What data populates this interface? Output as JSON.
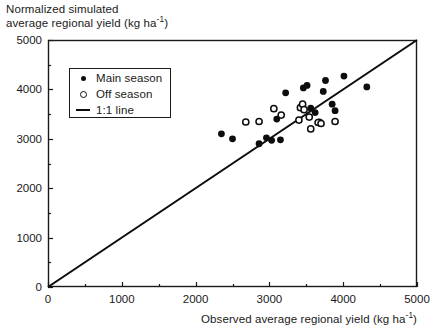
{
  "chart_data": {
    "type": "scatter",
    "title": "",
    "xlabel": "Observed average regional yield (kg ha-1)",
    "ylabel": "Normalized simulated average regional yield (kg ha-1)",
    "ylabel_line1": "Normalized simulated",
    "ylabel_line2": "average regional yield (kg ha",
    "xlabel_prefix": "Observed average regional yield (kg ha",
    "unit_exponent": "-1",
    "unit_suffix": ")",
    "xlim": [
      0,
      5000
    ],
    "ylim": [
      0,
      5000
    ],
    "xticks": [
      0,
      1000,
      2000,
      3000,
      4000,
      5000
    ],
    "yticks": [
      0,
      1000,
      2000,
      3000,
      4000,
      5000
    ],
    "xtick_labels": [
      "0",
      "1000",
      "2000",
      "3000",
      "4000",
      "5000"
    ],
    "ytick_labels": [
      "0",
      "1000",
      "2000",
      "3000",
      "4000",
      "5000"
    ],
    "minor_tick_step": 500,
    "grid": false,
    "legend_position": "upper left",
    "legend": [
      {
        "key": "filled-circle",
        "label": "Main season"
      },
      {
        "key": "open-circle",
        "label": "Off season"
      },
      {
        "key": "line",
        "label": "1:1 line"
      }
    ],
    "reference_line": {
      "name": "1:1 line",
      "from": [
        0,
        0
      ],
      "to": [
        5000,
        5000
      ]
    },
    "series": [
      {
        "name": "Main season",
        "marker": "filled-circle",
        "color": "#0d0d0d",
        "points": [
          [
            2350,
            3100
          ],
          [
            2960,
            3020
          ],
          [
            2860,
            2900
          ],
          [
            3030,
            2970
          ],
          [
            3150,
            2980
          ],
          [
            3100,
            3400
          ],
          [
            3220,
            3930
          ],
          [
            3440,
            3660
          ],
          [
            3460,
            4030
          ],
          [
            3510,
            4080
          ],
          [
            3560,
            3620
          ],
          [
            3620,
            3530
          ],
          [
            3680,
            3340
          ],
          [
            3730,
            3960
          ],
          [
            3760,
            4180
          ],
          [
            3850,
            3700
          ],
          [
            3890,
            3570
          ],
          [
            4010,
            4270
          ],
          [
            4320,
            4050
          ],
          [
            2500,
            3000
          ]
        ]
      },
      {
        "name": "Off season",
        "marker": "open-circle",
        "color": "#0d0d0d",
        "points": [
          [
            2680,
            3340
          ],
          [
            2860,
            3350
          ],
          [
            3060,
            3610
          ],
          [
            3160,
            3480
          ],
          [
            3420,
            3630
          ],
          [
            3450,
            3700
          ],
          [
            3400,
            3380
          ],
          [
            3540,
            3440
          ],
          [
            3560,
            3200
          ],
          [
            3660,
            3330
          ],
          [
            3700,
            3310
          ],
          [
            3890,
            3350
          ],
          [
            3470,
            3590
          ]
        ]
      }
    ]
  },
  "axes": {
    "plot_left_px": 48,
    "plot_right_px": 417,
    "plot_top_px": 40,
    "plot_bottom_px": 287
  }
}
